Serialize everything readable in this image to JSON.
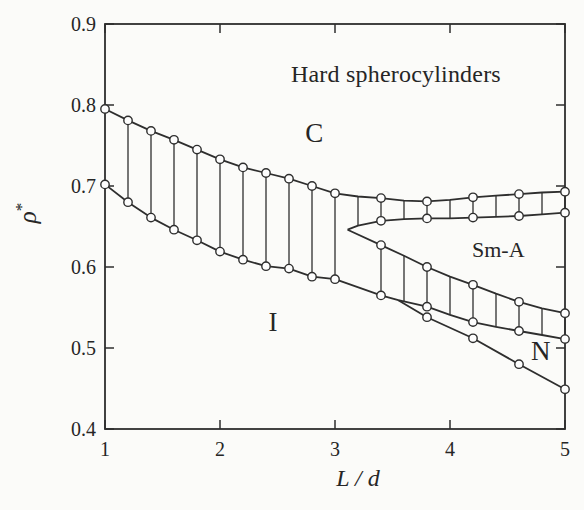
{
  "chart_data": {
    "type": "line",
    "title": "Hard spherocylinders",
    "title_pos": [
      3.53,
      0.838
    ],
    "xlabel": "L / d",
    "ylabel": "ρ*",
    "ylabel_base": "ρ",
    "ylabel_sup": "*",
    "xlim": [
      1,
      5
    ],
    "ylim": [
      0.4,
      0.9
    ],
    "x_ticks": [
      1,
      2,
      3,
      4,
      5
    ],
    "x_tick_labels": [
      "1",
      "2",
      "3",
      "4",
      "5"
    ],
    "y_ticks": [
      0.9,
      0.8,
      0.7,
      0.6,
      0.5,
      0.4
    ],
    "y_tick_labels": [
      "0.9",
      "0.8",
      "0.7",
      "0.6",
      "0.5",
      "0.4"
    ],
    "grid": false,
    "legend": "none",
    "colors": {
      "line": "#2e2e2e",
      "marker_fill": "#fdfdfd",
      "background": "#fbfbf9"
    },
    "phase_labels": [
      {
        "text": "C",
        "x": 2.82,
        "y": 0.765
      },
      {
        "text": "I",
        "x": 2.46,
        "y": 0.532
      },
      {
        "text": "Sm-A",
        "x": 4.42,
        "y": 0.621
      },
      {
        "text": "N",
        "x": 4.79,
        "y": 0.496
      }
    ],
    "series": [
      {
        "id": "ic_upper",
        "label": "I-C coexistence, crystal side",
        "points": [
          [
            1.0,
            0.795
          ],
          [
            1.2,
            0.781
          ],
          [
            1.4,
            0.768
          ],
          [
            1.6,
            0.757
          ],
          [
            1.8,
            0.745
          ],
          [
            2.0,
            0.733
          ],
          [
            2.2,
            0.723
          ],
          [
            2.4,
            0.716
          ],
          [
            2.6,
            0.709
          ],
          [
            2.8,
            0.7
          ],
          [
            3.0,
            0.691
          ]
        ],
        "marker_xs": "all"
      },
      {
        "id": "ic_lower",
        "label": "I-C coexistence, isotropic side",
        "points": [
          [
            1.0,
            0.702
          ],
          [
            1.2,
            0.68
          ],
          [
            1.4,
            0.661
          ],
          [
            1.6,
            0.646
          ],
          [
            1.8,
            0.633
          ],
          [
            2.0,
            0.619
          ],
          [
            2.2,
            0.609
          ],
          [
            2.4,
            0.601
          ],
          [
            2.6,
            0.598
          ],
          [
            2.8,
            0.588
          ],
          [
            3.0,
            0.585
          ]
        ],
        "marker_xs": "all"
      },
      {
        "id": "smc_upper",
        "label": "Sm-A-C coexistence, crystal side",
        "points": [
          [
            3.0,
            0.691
          ],
          [
            3.2,
            0.687
          ],
          [
            3.4,
            0.685
          ],
          [
            3.6,
            0.682
          ],
          [
            3.8,
            0.681
          ],
          [
            4.0,
            0.683
          ],
          [
            4.2,
            0.686
          ],
          [
            4.4,
            0.688
          ],
          [
            4.6,
            0.69
          ],
          [
            4.8,
            0.692
          ],
          [
            5.0,
            0.693
          ]
        ],
        "marker_xs": [
          3.4,
          3.8,
          4.2,
          4.6,
          5.0
        ]
      },
      {
        "id": "smc_lower",
        "label": "Sm-A-C coexistence, smectic side",
        "points": [
          [
            3.11,
            0.646
          ],
          [
            3.2,
            0.651
          ],
          [
            3.4,
            0.657
          ],
          [
            3.6,
            0.659
          ],
          [
            3.8,
            0.66
          ],
          [
            4.0,
            0.66
          ],
          [
            4.2,
            0.661
          ],
          [
            4.4,
            0.662
          ],
          [
            4.6,
            0.663
          ],
          [
            4.8,
            0.665
          ],
          [
            5.0,
            0.667
          ]
        ],
        "marker_xs": [
          3.4,
          3.8,
          4.2,
          4.6,
          5.0
        ]
      },
      {
        "id": "sm_low_top",
        "label": "I/N-Sm-A coexistence, smectic side",
        "points": [
          [
            3.11,
            0.646
          ],
          [
            3.4,
            0.627
          ],
          [
            3.6,
            0.614
          ],
          [
            3.8,
            0.6
          ],
          [
            4.0,
            0.588
          ],
          [
            4.2,
            0.578
          ],
          [
            4.4,
            0.567
          ],
          [
            4.6,
            0.557
          ],
          [
            4.8,
            0.549
          ],
          [
            5.0,
            0.543
          ]
        ],
        "marker_xs": [
          3.4,
          3.8,
          4.2,
          4.6,
          5.0
        ]
      },
      {
        "id": "low_bottom",
        "label": "I-Sm-A / N-Sm-A coexistence, lower side",
        "points": [
          [
            3.0,
            0.585
          ],
          [
            3.4,
            0.565
          ],
          [
            3.55,
            0.559
          ],
          [
            3.8,
            0.551
          ],
          [
            4.0,
            0.541
          ],
          [
            4.2,
            0.532
          ],
          [
            4.4,
            0.526
          ],
          [
            4.6,
            0.521
          ],
          [
            4.8,
            0.516
          ],
          [
            5.0,
            0.511
          ]
        ],
        "marker_xs": [
          3.4,
          3.8,
          4.2,
          4.6,
          5.0
        ]
      },
      {
        "id": "in_line",
        "label": "I-N transition line",
        "points": [
          [
            3.55,
            0.559
          ],
          [
            3.8,
            0.538
          ],
          [
            4.2,
            0.512
          ],
          [
            4.6,
            0.48
          ],
          [
            5.0,
            0.449
          ]
        ],
        "marker_xs": [
          3.8,
          4.2,
          4.6,
          5.0
        ]
      }
    ],
    "tie_lines": [
      {
        "between": [
          "ic_lower",
          "ic_upper"
        ],
        "xs": [
          1.2,
          1.4,
          1.6,
          1.8,
          2.0,
          2.2,
          2.4,
          2.6,
          2.8,
          3.0
        ]
      },
      {
        "between": [
          "smc_lower",
          "smc_upper"
        ],
        "xs": [
          3.2,
          3.4,
          3.6,
          3.8,
          4.0,
          4.2,
          4.4,
          4.6,
          4.8,
          5.0
        ]
      },
      {
        "between": [
          "low_bottom",
          "sm_low_top"
        ],
        "xs": [
          3.4,
          3.6,
          3.8,
          4.0,
          4.2,
          4.4,
          4.6,
          4.8,
          5.0
        ]
      }
    ]
  }
}
